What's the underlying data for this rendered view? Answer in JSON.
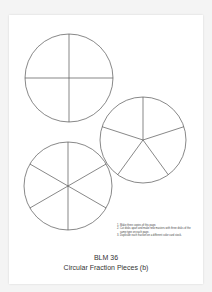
{
  "document": {
    "title": "BLM 36",
    "subtitle": "Circular Fraction Pieces (b)",
    "instructions": [
      "Make three copies of this page.",
      "Cut disks apart and make new masters with three disks of the same type on each page.",
      "Duplicate each fraction on a different color card stock."
    ],
    "disks": [
      {
        "name": "fourths",
        "pieces": 4
      },
      {
        "name": "fifths",
        "pieces": 5
      },
      {
        "name": "sixths",
        "pieces": 6
      }
    ],
    "line_color": "#555555"
  }
}
